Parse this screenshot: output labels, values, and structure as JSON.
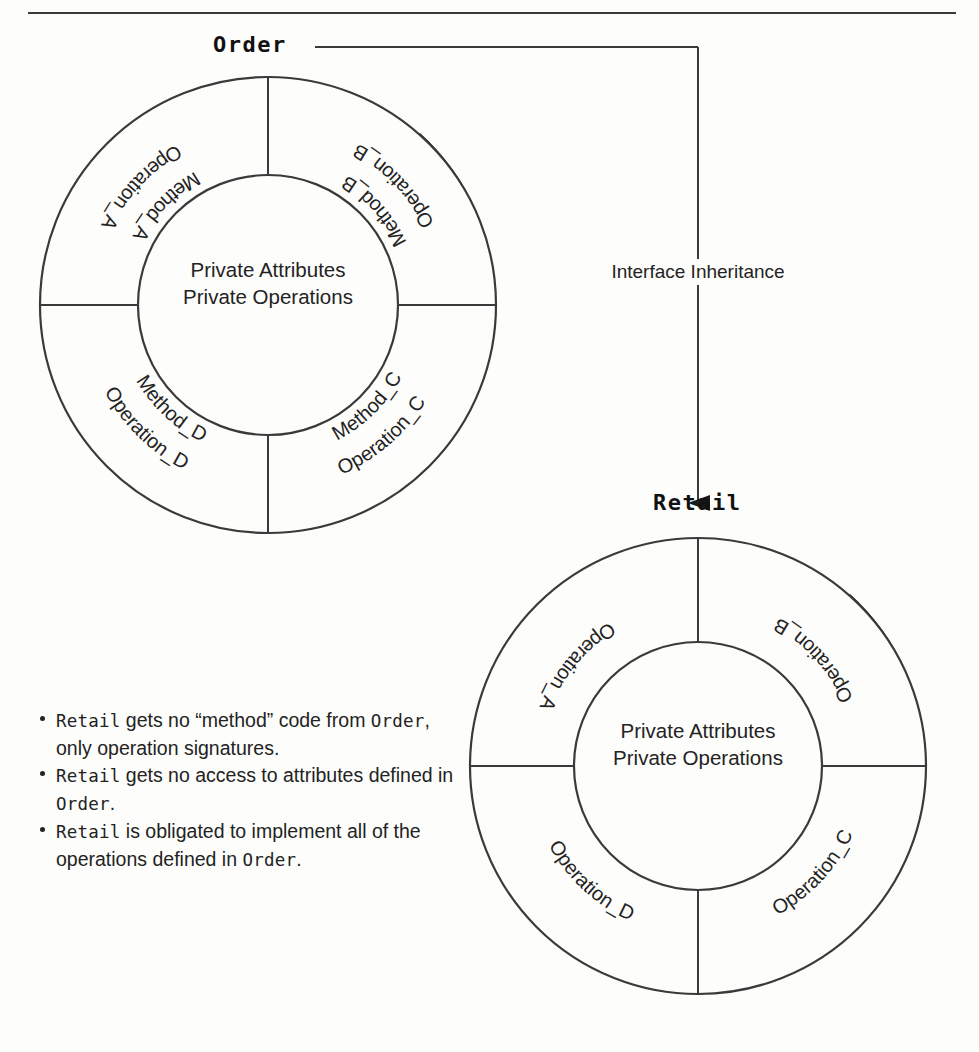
{
  "diagram": {
    "title_order": "Order",
    "title_retail": "Retail",
    "edge_label": "Interface Inheritance",
    "core_line1": "Private Attributes",
    "core_line2": "Private Operations",
    "colors": {
      "ink": "#232323",
      "line": "#3a3a3a",
      "shadow": "#111111",
      "paper": "#fdfdfb"
    }
  },
  "order_class": {
    "name": "Order",
    "core": [
      "Private Attributes",
      "Private Operations"
    ],
    "sectors": [
      {
        "id": "A",
        "quadrant": "top-left",
        "lines": [
          "Operation_A",
          "Method_A"
        ]
      },
      {
        "id": "B",
        "quadrant": "top-right",
        "lines": [
          "Operation_B",
          "Method_B"
        ]
      },
      {
        "id": "C",
        "quadrant": "bottom-right",
        "lines": [
          "Method_C",
          "Operation_C"
        ]
      },
      {
        "id": "D",
        "quadrant": "bottom-left",
        "lines": [
          "Method_D",
          "Operation_D"
        ]
      }
    ]
  },
  "retail_class": {
    "name": "Retail",
    "core": [
      "Private Attributes",
      "Private Operations"
    ],
    "sectors": [
      {
        "id": "A",
        "quadrant": "top-left",
        "lines": [
          "Operation_A"
        ]
      },
      {
        "id": "B",
        "quadrant": "top-right",
        "lines": [
          "Operation_B"
        ]
      },
      {
        "id": "C",
        "quadrant": "bottom-right",
        "lines": [
          "Operation_C"
        ]
      },
      {
        "id": "D",
        "quadrant": "bottom-left",
        "lines": [
          "Operation_D"
        ]
      }
    ]
  },
  "notes": [
    {
      "parts": [
        {
          "text": "Retail",
          "style": "mono"
        },
        {
          "text": " gets no “method” code from ",
          "style": "normal"
        },
        {
          "text": "Order",
          "style": "mono"
        },
        {
          "text": ", only operation signatures.",
          "style": "normal"
        }
      ]
    },
    {
      "parts": [
        {
          "text": "Retail",
          "style": "mono"
        },
        {
          "text": " gets no access to attributes defined in ",
          "style": "normal"
        },
        {
          "text": "Order",
          "style": "mono"
        },
        {
          "text": ".",
          "style": "normal"
        }
      ]
    },
    {
      "parts": [
        {
          "text": "Retail",
          "style": "mono"
        },
        {
          "text": " is obligated to implement all of the operations defined in ",
          "style": "normal"
        },
        {
          "text": "Order",
          "style": "mono"
        },
        {
          "text": ".",
          "style": "normal"
        }
      ]
    }
  ],
  "notes_flat": [
    "Retail gets no “method” code from Order, only operation signatures.",
    "Retail gets no access to attributes defined in Order.",
    "Retail is obligated to implement all of the operations defined in Order."
  ],
  "note_lines": [
    [
      "Retail",
      " gets no “method” code",
      "from ",
      "Order",
      ", only operation",
      "signatures."
    ],
    [
      "Retail",
      " gets no access to attributes",
      "defined in ",
      "Order",
      "."
    ],
    [
      "Retail",
      " is obligated to implement",
      "all of the operations defined",
      "in ",
      "Order",
      "."
    ]
  ]
}
